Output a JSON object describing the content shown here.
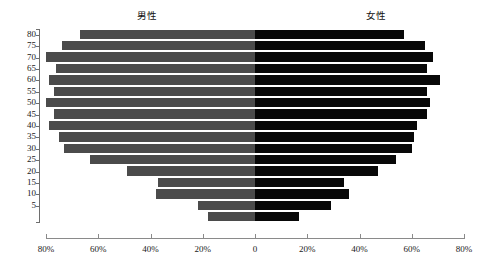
{
  "chart_data": {
    "type": "bar",
    "subtype": "population-pyramid",
    "title": "",
    "xlabel": "",
    "ylabel": "",
    "grid": false,
    "legend_position": "top",
    "orientation": "horizontal-diverging",
    "categories": [
      "80",
      "75",
      "70",
      "65",
      "60",
      "55",
      "50",
      "45",
      "40",
      "35",
      "30",
      "25",
      "20",
      "15",
      "10",
      "5",
      ""
    ],
    "category_axis_labels": [
      "80",
      "75",
      "70",
      "65",
      "60",
      "55",
      "50",
      "45",
      "40",
      "35",
      "30",
      "25",
      "20",
      "15",
      "10",
      "5"
    ],
    "x_tick_labels": [
      "80%",
      "60%",
      "40%",
      "20%",
      "0",
      "20%",
      "40%",
      "60%",
      "80%"
    ],
    "x_tick_values": [
      -80,
      -60,
      -40,
      -20,
      0,
      20,
      40,
      60,
      80
    ],
    "xlim": [
      -80,
      80
    ],
    "series": [
      {
        "name": "男性",
        "side": "left",
        "color": "#4b4b4b",
        "values": [
          67,
          74,
          80,
          76,
          79,
          77,
          80,
          77,
          79,
          75,
          73,
          63,
          49,
          37,
          38,
          22,
          18
        ]
      },
      {
        "name": "女性",
        "side": "right",
        "color": "#080808",
        "values": [
          57,
          65,
          68,
          66,
          71,
          66,
          67,
          66,
          62,
          61,
          60,
          54,
          47,
          34,
          36,
          29,
          17
        ]
      }
    ]
  },
  "legend": {
    "male_label": "男性",
    "female_label": "女性"
  }
}
